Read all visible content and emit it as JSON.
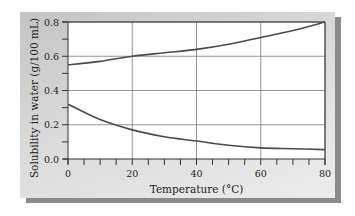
{
  "chart_data": {
    "type": "line",
    "title": "",
    "xlabel": "Temperature (°C)",
    "ylabel": "Solubility in water (g/100 mL)",
    "xlim": [
      0,
      80
    ],
    "ylim": [
      0.0,
      0.8
    ],
    "x_ticks": [
      "0",
      "20",
      "40",
      "60",
      "80"
    ],
    "y_ticks": [
      "0.0",
      "0.2",
      "0.4",
      "0.6",
      "0.8"
    ],
    "grid": true,
    "legend": null,
    "x": [
      0,
      10,
      20,
      30,
      40,
      50,
      60,
      70,
      80
    ],
    "series": [
      {
        "name": "upper curve (increasing)",
        "values": [
          0.55,
          0.57,
          0.6,
          0.62,
          0.64,
          0.67,
          0.71,
          0.75,
          0.8
        ]
      },
      {
        "name": "lower curve (decreasing)",
        "values": [
          0.32,
          0.23,
          0.17,
          0.13,
          0.105,
          0.08,
          0.065,
          0.06,
          0.055
        ]
      }
    ]
  },
  "labels": {
    "xlabel": "Temperature (°C)",
    "ylabel": "Solubility in water (g/100 mL)"
  },
  "colors": {
    "curve": "#4a4a4a",
    "grid": "#7a7a7a",
    "panel": "#d4d4d4"
  }
}
